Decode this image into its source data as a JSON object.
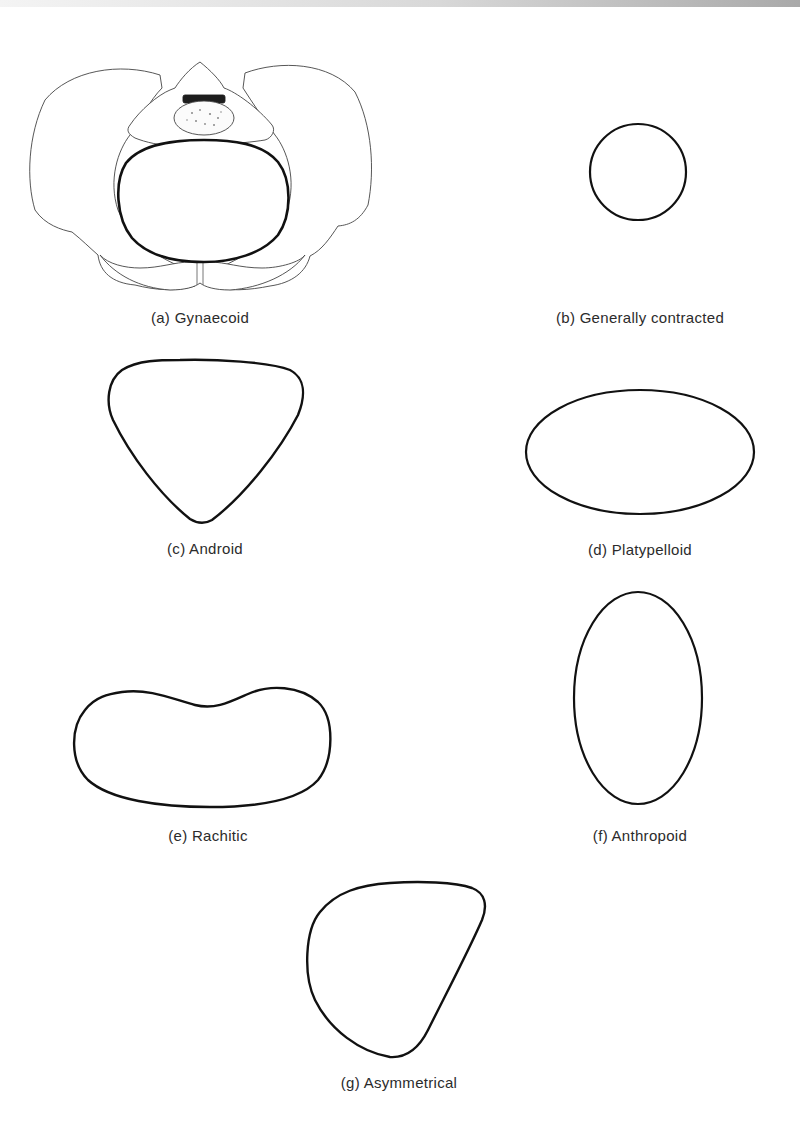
{
  "figure": {
    "panels": [
      {
        "id": "a",
        "label": "(a)",
        "name": "Gynaecoid",
        "caption": "(a)  Gynaecoid",
        "shape": "round inlet drawn within pelvis illustration"
      },
      {
        "id": "b",
        "label": "(b)",
        "name": "Generally contracted",
        "caption": "(b)  Generally contracted",
        "shape": "small circle"
      },
      {
        "id": "c",
        "label": "(c)",
        "name": "Android",
        "caption": "(c)  Android",
        "shape": "heart / rounded triangle"
      },
      {
        "id": "d",
        "label": "(d)",
        "name": "Platypelloid",
        "caption": "(d)  Platypelloid",
        "shape": "wide horizontal ellipse"
      },
      {
        "id": "e",
        "label": "(e)",
        "name": "Rachitic",
        "caption": "(e)  Rachitic",
        "shape": "kidney / bean"
      },
      {
        "id": "f",
        "label": "(f)",
        "name": "Anthropoid",
        "caption": "(f)  Anthropoid",
        "shape": "tall vertical ellipse"
      },
      {
        "id": "g",
        "label": "(g)",
        "name": "Asymmetrical",
        "caption": "(g)  Asymmetrical",
        "shape": "irregular asymmetric oval"
      }
    ],
    "colors": {
      "stroke": "#111111",
      "fine_line": "#555555",
      "background": "#ffffff",
      "caption_text": "#2b2b2b"
    }
  }
}
